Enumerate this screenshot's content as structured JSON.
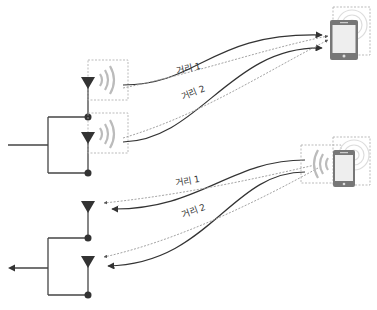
{
  "diagram": {
    "type": "antenna-diversity-illustration",
    "top_panel": {
      "description": "Transmit: two antennas send signals to a phone",
      "labels": {
        "distance_1": "거리 1",
        "distance_2": "거리 2"
      },
      "antennas": [
        {
          "id": "tx-antenna-1",
          "x": 88,
          "y": 82
        },
        {
          "id": "tx-antenna-2",
          "x": 88,
          "y": 136
        }
      ],
      "phone": {
        "x": 330,
        "y": 20,
        "w": 28,
        "h": 40
      }
    },
    "bottom_panel": {
      "description": "Receive: phone sends signals back to two antennas",
      "labels": {
        "distance_1": "거리 1",
        "distance_2": "거리 2"
      },
      "antennas": [
        {
          "id": "rx-antenna-1",
          "x": 88,
          "y": 207
        },
        {
          "id": "rx-antenna-2",
          "x": 88,
          "y": 262
        }
      ],
      "phone": {
        "x": 333,
        "y": 150,
        "w": 22,
        "h": 37
      }
    },
    "colors": {
      "line": "#333333",
      "dashed": "#999999",
      "wave": "#bbbbbb",
      "phone_body": "#777777",
      "phone_screen": "#eeeeee",
      "box_border": "#aaaaaa"
    }
  }
}
